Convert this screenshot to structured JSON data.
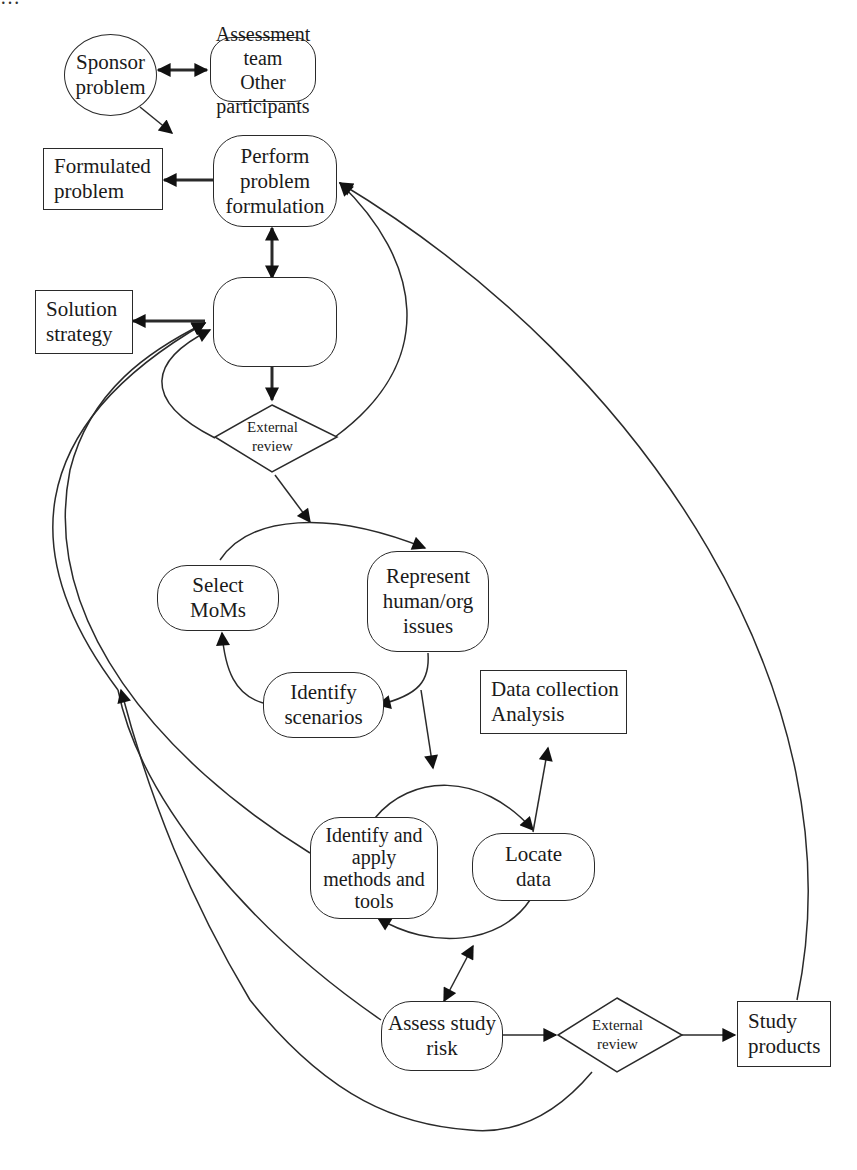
{
  "diagram": {
    "top_caption_cut": "…",
    "nodes": {
      "sponsor_problem": "Sponsor\nproblem",
      "assessment_team": "Assessment team\nOther participants",
      "perform_formulation": "Perform\nproblem\nformulation",
      "formulated_problem": "Formulated\nproblem",
      "specify_strategy": "Specify\nsolution\nstrategy",
      "solution_strategy": "Solution\nstrategy",
      "external_review_1": "External\nreview",
      "select_moms": "Select\nMoMs",
      "represent_issues": "Represent\nhuman/org\nissues",
      "identify_scenarios": "Identify\nscenarios",
      "data_collection": "Data collection\nAnalysis",
      "identify_methods": "Identify and\napply\nmethods and\ntools",
      "locate_data": "Locate\ndata",
      "assess_risk": "Assess study\nrisk",
      "external_review_2": "External\nreview",
      "study_products": "Study\nproducts"
    },
    "colors": {
      "stroke": "#2a2a2a",
      "background": "#ffffff"
    }
  }
}
